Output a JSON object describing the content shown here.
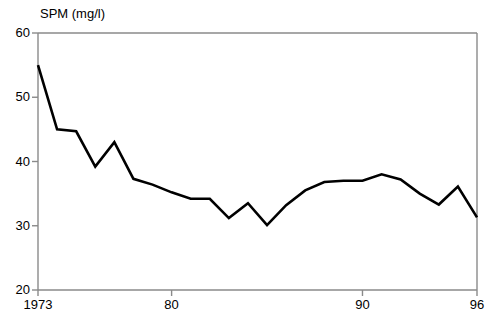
{
  "chart_data": {
    "type": "line",
    "title": "SPM (mg/l)",
    "xlabel": "",
    "ylabel": "SPM (mg/l)",
    "ylim": [
      20,
      60
    ],
    "xlim": [
      1973,
      1996
    ],
    "grid": false,
    "legend": null,
    "yticks": [
      20,
      30,
      40,
      50,
      60
    ],
    "ytick_labels": [
      "20",
      "30",
      "40",
      "50",
      "60"
    ],
    "xticks": [
      1973,
      1980,
      1990,
      1996
    ],
    "xtick_labels": [
      "1973",
      "80",
      "90",
      "96"
    ],
    "line_color": "#000000",
    "axis_color": "#808080",
    "x": [
      1973,
      1974,
      1975,
      1976,
      1977,
      1978,
      1979,
      1980,
      1981,
      1982,
      1983,
      1984,
      1985,
      1986,
      1987,
      1988,
      1989,
      1990,
      1991,
      1992,
      1993,
      1994,
      1995,
      1996
    ],
    "values": [
      55.0,
      45.0,
      44.7,
      39.2,
      43.0,
      37.3,
      36.4,
      35.2,
      34.2,
      34.2,
      31.2,
      33.5,
      30.1,
      33.2,
      35.5,
      36.8,
      37.0,
      37.0,
      38.0,
      37.2,
      35.0,
      33.3,
      36.1,
      31.3
    ],
    "series": [
      {
        "name": "SPM",
        "values": [
          55.0,
          45.0,
          44.7,
          39.2,
          43.0,
          37.3,
          36.4,
          35.2,
          34.2,
          34.2,
          31.2,
          33.5,
          30.1,
          33.2,
          35.5,
          36.8,
          37.0,
          37.0,
          38.0,
          37.2,
          35.0,
          33.3,
          36.1,
          31.3
        ]
      }
    ]
  }
}
